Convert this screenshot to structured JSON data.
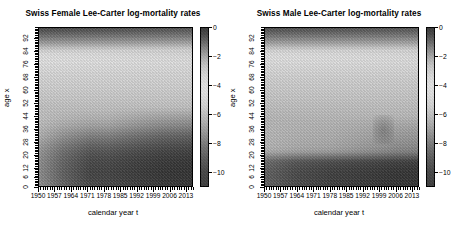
{
  "figure": {
    "background": "#ffffff",
    "panel_count": 2
  },
  "panels": [
    {
      "id": "female",
      "title": "Swiss Female Lee-Carter log-mortality rates",
      "xlabel": "calendar year t",
      "ylabel": "age x",
      "xticks": [
        "1950",
        "1957",
        "1964",
        "1971",
        "1978",
        "1985",
        "1992",
        "1999",
        "2006",
        "2013"
      ],
      "yticks": [
        "0",
        "6",
        "12",
        "20",
        "28",
        "36",
        "44",
        "52",
        "60",
        "68",
        "76",
        "84",
        "92"
      ],
      "colorbar_ticks": [
        "0",
        "-2",
        "-4",
        "-6",
        "-8",
        "-10"
      ]
    },
    {
      "id": "male",
      "title": "Swiss Male Lee-Carter log-mortality rates",
      "xlabel": "calendar year t",
      "ylabel": "age x",
      "xticks": [
        "1950",
        "1957",
        "1964",
        "1971",
        "1978",
        "1985",
        "1992",
        "1999",
        "2006",
        "2013"
      ],
      "yticks": [
        "0",
        "6",
        "12",
        "20",
        "28",
        "36",
        "44",
        "52",
        "60",
        "68",
        "76",
        "84",
        "92"
      ],
      "colorbar_ticks": [
        "0",
        "-2",
        "-4",
        "-6",
        "-8",
        "-10"
      ]
    }
  ],
  "chart_data": [
    {
      "type": "heatmap",
      "title": "Swiss Female Lee-Carter log-mortality rates",
      "xlabel": "calendar year t",
      "ylabel": "age x",
      "colormap": "grayscale",
      "colorbar_label": "",
      "zlim": [
        -11,
        0
      ],
      "zticks": [
        0,
        -2,
        -4,
        -6,
        -8,
        -10
      ],
      "xlim": [
        1950,
        2016
      ],
      "ylim": [
        0,
        99
      ],
      "xticks": [
        1950,
        1957,
        1964,
        1971,
        1978,
        1985,
        1992,
        1999,
        2006,
        2013
      ],
      "yticks": [
        0,
        6,
        12,
        20,
        28,
        36,
        44,
        52,
        60,
        68,
        76,
        84,
        92
      ],
      "grid": false,
      "legend": "colorbar-right",
      "description": "log-mortality surface: darkest (near 0) at oldest ages top, light mid-ages, dark (near -10) at young ages bottom",
      "z_by_age_1950": [
        -7.1,
        -9.3,
        -9.6,
        -9.2,
        -8.6,
        -8.0,
        -7.4,
        -6.7,
        -5.9,
        -5.0,
        -4.0,
        -2.9,
        -1.7,
        -0.8
      ],
      "z_by_age_2013": [
        -8.5,
        -10.3,
        -10.5,
        -10.0,
        -9.3,
        -8.6,
        -7.8,
        -6.9,
        -6.0,
        -5.1,
        -4.1,
        -3.0,
        -1.8,
        -0.7
      ],
      "age_grid": [
        0,
        6,
        12,
        20,
        28,
        36,
        44,
        52,
        60,
        68,
        76,
        84,
        92,
        99
      ]
    },
    {
      "type": "heatmap",
      "title": "Swiss Male Lee-Carter log-mortality rates",
      "xlabel": "calendar year t",
      "ylabel": "age x",
      "colormap": "grayscale",
      "colorbar_label": "",
      "zlim": [
        -11,
        0
      ],
      "zticks": [
        0,
        -2,
        -4,
        -6,
        -8,
        -10
      ],
      "xlim": [
        1950,
        2016
      ],
      "ylim": [
        0,
        99
      ],
      "xticks": [
        1950,
        1957,
        1964,
        1971,
        1978,
        1985,
        1992,
        1999,
        2006,
        2013
      ],
      "yticks": [
        0,
        6,
        12,
        20,
        28,
        36,
        44,
        52,
        60,
        68,
        76,
        84,
        92
      ],
      "grid": false,
      "legend": "colorbar-right",
      "description": "log-mortality surface: flatter dark band at young ages, light broad mid-age plateau, dark at oldest ages",
      "z_by_age_1950": [
        -6.9,
        -9.1,
        -9.4,
        -8.3,
        -7.9,
        -7.5,
        -7.0,
        -6.3,
        -5.4,
        -4.5,
        -3.6,
        -2.6,
        -1.5,
        -0.7
      ],
      "z_by_age_2013": [
        -8.3,
        -10.1,
        -10.3,
        -9.1,
        -8.6,
        -8.2,
        -7.5,
        -6.6,
        -5.6,
        -4.6,
        -3.7,
        -2.7,
        -1.6,
        -0.6
      ],
      "age_grid": [
        0,
        6,
        12,
        20,
        28,
        36,
        44,
        52,
        60,
        68,
        76,
        84,
        92,
        99
      ]
    }
  ]
}
